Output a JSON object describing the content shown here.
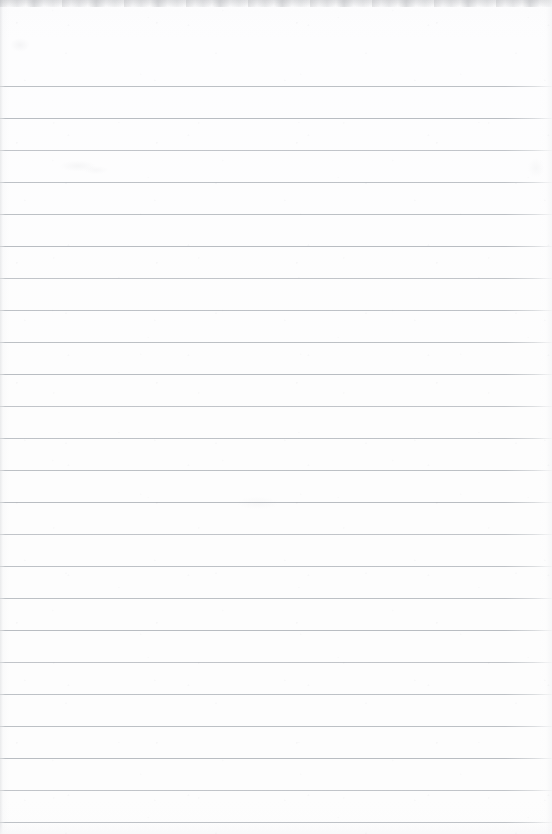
{
  "document": {
    "kind": "lined-notepad-page",
    "title": "Blank ruled notepad page",
    "content_text": "",
    "is_blank": true,
    "page_width": 552,
    "page_height": 834
  },
  "paper": {
    "background_color": "#fdfdfd",
    "top_band_color": "#9a9da2",
    "edge_shadow_color": "#b0b3b8",
    "noise_opacity": "0.40"
  },
  "ruling": {
    "rule_color": "#b9bdc2",
    "rule_thickness_px": 1,
    "first_rule_y": 86,
    "line_spacing_px": 32,
    "rule_count": 24,
    "left_margin_rule": false,
    "rule_y_positions": [
      86,
      118,
      150,
      182,
      214,
      246,
      278,
      310,
      342,
      374,
      406,
      438,
      470,
      502,
      534,
      566,
      598,
      630,
      662,
      694,
      726,
      758,
      790,
      822
    ],
    "line_labels": [
      "rule-1",
      "rule-2",
      "rule-3",
      "rule-4",
      "rule-5",
      "rule-6",
      "rule-7",
      "rule-8",
      "rule-9",
      "rule-10",
      "rule-11",
      "rule-12",
      "rule-13",
      "rule-14",
      "rule-15",
      "rule-16",
      "rule-17",
      "rule-18",
      "rule-19",
      "rule-20",
      "rule-21",
      "rule-22",
      "rule-23",
      "rule-24"
    ]
  },
  "header_area": {
    "top_blank_height_px": 86,
    "text": ""
  }
}
